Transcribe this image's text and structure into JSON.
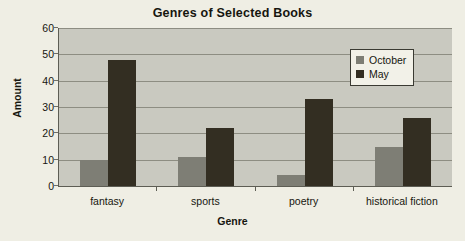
{
  "chart_data": {
    "type": "bar",
    "title": "Genres of Selected Books",
    "xlabel": "Genre",
    "ylabel": "Amount",
    "categories": [
      "fantasy",
      "sports",
      "poetry",
      "historical fiction"
    ],
    "series": [
      {
        "name": "October",
        "color": "#7e7e75",
        "values": [
          10,
          11,
          4,
          15
        ]
      },
      {
        "name": "May",
        "color": "#332e22",
        "values": [
          48,
          22,
          33,
          26
        ]
      }
    ],
    "ylim": [
      0,
      60
    ],
    "yticks": [
      0,
      10,
      20,
      30,
      40,
      50,
      60
    ],
    "ytick_labels": [
      "0",
      "10",
      "20",
      "30",
      "40",
      "50",
      "60"
    ],
    "grid": true,
    "grid_axis": "y",
    "legend_position": "upper right",
    "plot_background": "#c9c9c0",
    "page_background": "#efeee4"
  }
}
